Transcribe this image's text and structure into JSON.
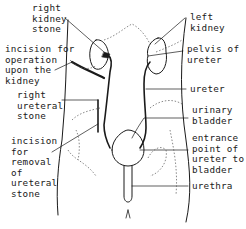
{
  "diagram": {
    "labels": {
      "right_kidney_stone": "right\nkidney\nstone",
      "incision_kidney": "incision for\noperation\nupon the\nkidney",
      "right_ureteral_stone": "right\nureteral\nstone",
      "incision_ureteral": "incision\nfor\nremoval\nof\nureteral\nstone",
      "left_kidney": "left\nkidney",
      "pelvis_of_ureter": "pelvis of\nureter",
      "ureter": "ureter",
      "urinary_bladder": "urinary\nbladder",
      "entrance_point": "entrance\npoint of\nureter to\nbladder",
      "urethra": "urethra"
    },
    "colors": {
      "line": "#1a1a1a",
      "dotted": "#555555",
      "background": "#ffffff"
    }
  }
}
